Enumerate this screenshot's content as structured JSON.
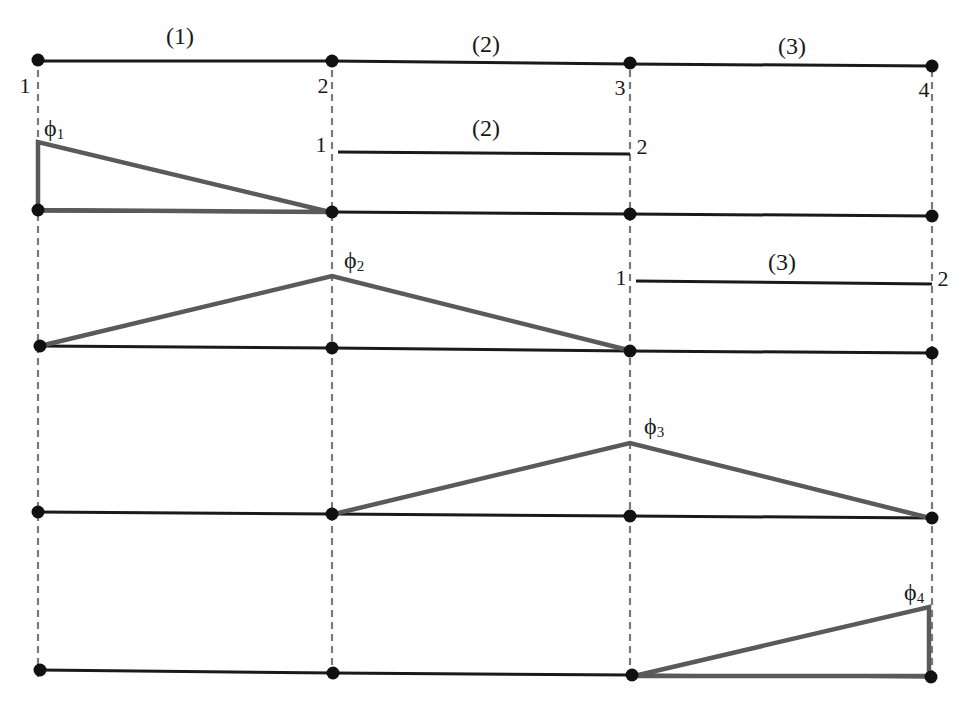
{
  "colors": {
    "mesh_line": "#1a1a1a",
    "node_dot": "#111111",
    "shape_function": "#5a5a5a",
    "guide_dashed": "#7a7a7a"
  },
  "mesh": {
    "elements": [
      {
        "label": "(1)"
      },
      {
        "label": "(2)"
      },
      {
        "label": "(3)"
      }
    ],
    "global_nodes": [
      "1",
      "2",
      "3",
      "4"
    ]
  },
  "local_elements": [
    {
      "label": "(2)",
      "local_start": "1",
      "local_end": "2"
    },
    {
      "label": "(3)",
      "local_start": "1",
      "local_end": "2"
    }
  ],
  "shape_functions": [
    {
      "symbol": "ϕ",
      "subscript": "1",
      "node": 1
    },
    {
      "symbol": "ϕ",
      "subscript": "2",
      "node": 2
    },
    {
      "symbol": "ϕ",
      "subscript": "3",
      "node": 3
    },
    {
      "symbol": "ϕ",
      "subscript": "4",
      "node": 4
    }
  ]
}
